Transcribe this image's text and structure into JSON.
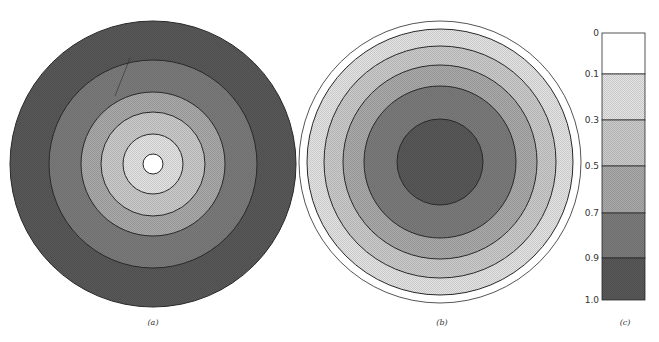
{
  "figure": {
    "panels": [
      {
        "id": "a",
        "label": "(a)",
        "label_pos": [
          153,
          324
        ],
        "center": [
          153,
          164
        ],
        "rings": [
          {
            "r": 143,
            "level": 5
          },
          {
            "r": 104,
            "level": 4
          },
          {
            "r": 72,
            "level": 3
          },
          {
            "r": 52,
            "level": 2
          },
          {
            "r": 30,
            "level": 1
          },
          {
            "r": 10,
            "level": 0
          }
        ]
      },
      {
        "id": "b",
        "label": "(b)",
        "label_pos": [
          442,
          324
        ],
        "center": [
          440,
          162
        ],
        "rings": [
          {
            "r": 141,
            "level": 0
          },
          {
            "r": 133,
            "level": 1
          },
          {
            "r": 116,
            "level": 2
          },
          {
            "r": 97,
            "level": 3
          },
          {
            "r": 76,
            "level": 4
          },
          {
            "r": 43,
            "level": 5
          }
        ]
      }
    ],
    "scale_bar": {
      "label": "(c)",
      "label_pos": [
        625,
        324
      ],
      "x": 602,
      "width": 43,
      "ticks": [
        {
          "value": "0",
          "y": 33
        },
        {
          "value": "0.1",
          "y": 74
        },
        {
          "value": "0.3",
          "y": 120
        },
        {
          "value": "0.5",
          "y": 166
        },
        {
          "value": "0.7",
          "y": 213
        },
        {
          "value": "0.9",
          "y": 258
        },
        {
          "value": "1.0",
          "y": 300
        }
      ]
    },
    "levels": [
      {
        "range": "0-0.1",
        "fill": "#ffffff"
      },
      {
        "range": "0.1-0.3",
        "fill": "#e4e4e4"
      },
      {
        "range": "0.3-0.5",
        "fill": "#cbcbcb"
      },
      {
        "range": "0.5-0.7",
        "fill": "#aaaaaa"
      },
      {
        "range": "0.7-0.9",
        "fill": "#7c7c7c"
      },
      {
        "range": "0.9-1.0",
        "fill": "#595959"
      }
    ],
    "stroke_color": "#2a2a2a"
  }
}
